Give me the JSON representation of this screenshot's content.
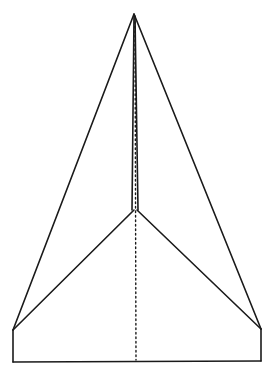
{
  "figure": {
    "subject": "paper airplane line drawing",
    "background": "#ffffff",
    "ink_color": "#1a1a1a",
    "points": {
      "apex": [
        134,
        14
      ],
      "junction": [
        135,
        210
      ],
      "left_wing_tip": [
        13,
        330
      ],
      "right_wing_tip": [
        261,
        329
      ],
      "bottom_left": [
        13,
        362
      ],
      "bottom_right": [
        261,
        361
      ],
      "center_bottom": [
        136,
        362
      ]
    }
  }
}
